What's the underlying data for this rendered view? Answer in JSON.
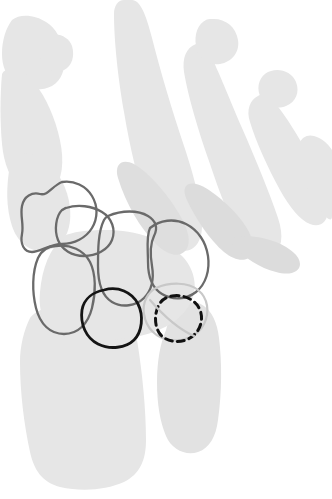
{
  "figure": {
    "title": "Hand and wrist skeleton outline diagram",
    "background_color": "#ffffff",
    "bone_fill_color": "#e6e6e6",
    "bone_fill_color_alt": "#e2e2e2"
  },
  "stroke_styles": {
    "gray_outline": {
      "color": "#6a6a6a",
      "width": 2.3,
      "dash": "none"
    },
    "black_outline": {
      "color": "#141414",
      "width": 2.8,
      "dash": "none"
    },
    "light_outline": {
      "color": "#c8c8c8",
      "width": 2.2,
      "dash": "none"
    },
    "dashed_outline": {
      "color": "#111111",
      "width": 3.0,
      "dash": "7 5"
    }
  },
  "skeleton": {
    "thumb": {
      "label": "thumb",
      "segments": [
        "distal-phalanx",
        "proximal-phalanx",
        "first-metacarpal"
      ]
    },
    "fingers": [
      {
        "label": "index-finger",
        "segments": [
          "phalanges",
          "second-metacarpal"
        ]
      },
      {
        "label": "middle-finger",
        "segments": [
          "phalanges",
          "third-metacarpal"
        ]
      },
      {
        "label": "ring-finger",
        "segments": [
          "phalanges",
          "fourth-metacarpal"
        ]
      },
      {
        "label": "little-finger",
        "segments": [
          "phalanges",
          "fifth-metacarpal"
        ]
      }
    ],
    "forearm": [
      {
        "label": "radius"
      },
      {
        "label": "ulna"
      }
    ]
  },
  "carpal_outlines": [
    {
      "name": "trapezium",
      "style": "gray_outline"
    },
    {
      "name": "trapezoid",
      "style": "gray_outline"
    },
    {
      "name": "scaphoid",
      "style": "gray_outline"
    },
    {
      "name": "capitate",
      "style": "gray_outline"
    },
    {
      "name": "hamate",
      "style": "gray_outline"
    },
    {
      "name": "lunate",
      "style": "black_outline"
    },
    {
      "name": "triquetrum",
      "style": "light_outline"
    },
    {
      "name": "pisiform",
      "style": "dashed_outline"
    }
  ]
}
